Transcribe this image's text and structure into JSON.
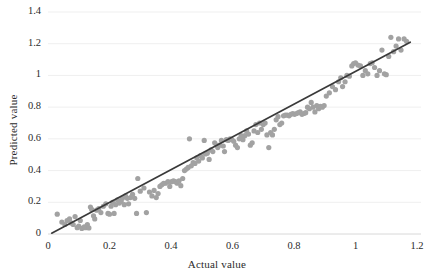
{
  "chart_data": {
    "type": "scatter",
    "title": "",
    "xlabel": "Actual value",
    "ylabel": "Predicted value",
    "xlim": [
      0,
      1.2
    ],
    "ylim": [
      0,
      1.4
    ],
    "xticks": [
      "0",
      "0.2",
      "0.4",
      "0.6",
      "0.8",
      "1",
      "1.2"
    ],
    "xtick_values": [
      0,
      0.2,
      0.4,
      0.6,
      0.8,
      1.0,
      1.2
    ],
    "yticks": [
      "0",
      "0.2",
      "0.4",
      "0.6",
      "0.8",
      "1",
      "1.2",
      "1.4"
    ],
    "ytick_values": [
      0,
      0.2,
      0.4,
      0.6,
      0.8,
      1.0,
      1.2,
      1.4
    ],
    "grid": "horizontal",
    "legend": "none",
    "marker_color": "#a2a2a2",
    "line_color": "#3a3a3a",
    "gridline_color": "#efefef",
    "background_color": "#ffffff",
    "series": [
      {
        "name": "Predicted vs actual",
        "type": "scatter",
        "points": [
          [
            0.03,
            0.125
          ],
          [
            0.045,
            0.075
          ],
          [
            0.055,
            0.06
          ],
          [
            0.062,
            0.085
          ],
          [
            0.07,
            0.095
          ],
          [
            0.075,
            0.07
          ],
          [
            0.082,
            0.06
          ],
          [
            0.088,
            0.11
          ],
          [
            0.095,
            0.04
          ],
          [
            0.1,
            0.05
          ],
          [
            0.105,
            0.085
          ],
          [
            0.11,
            0.035
          ],
          [
            0.118,
            0.045
          ],
          [
            0.122,
            0.04
          ],
          [
            0.128,
            0.06
          ],
          [
            0.133,
            0.038
          ],
          [
            0.138,
            0.17
          ],
          [
            0.142,
            0.155
          ],
          [
            0.148,
            0.115
          ],
          [
            0.152,
            0.095
          ],
          [
            0.158,
            0.15
          ],
          [
            0.165,
            0.16
          ],
          [
            0.172,
            0.135
          ],
          [
            0.18,
            0.175
          ],
          [
            0.188,
            0.19
          ],
          [
            0.195,
            0.13
          ],
          [
            0.2,
            0.125
          ],
          [
            0.205,
            0.175
          ],
          [
            0.21,
            0.2
          ],
          [
            0.215,
            0.13
          ],
          [
            0.22,
            0.185
          ],
          [
            0.226,
            0.215
          ],
          [
            0.232,
            0.195
          ],
          [
            0.238,
            0.205
          ],
          [
            0.242,
            0.225
          ],
          [
            0.248,
            0.185
          ],
          [
            0.252,
            0.24
          ],
          [
            0.258,
            0.225
          ],
          [
            0.262,
            0.19
          ],
          [
            0.268,
            0.23
          ],
          [
            0.275,
            0.25
          ],
          [
            0.282,
            0.225
          ],
          [
            0.288,
            0.13
          ],
          [
            0.292,
            0.35
          ],
          [
            0.3,
            0.27
          ],
          [
            0.312,
            0.29
          ],
          [
            0.32,
            0.135
          ],
          [
            0.33,
            0.265
          ],
          [
            0.338,
            0.24
          ],
          [
            0.345,
            0.275
          ],
          [
            0.352,
            0.23
          ],
          [
            0.358,
            0.255
          ],
          [
            0.364,
            0.3
          ],
          [
            0.37,
            0.31
          ],
          [
            0.376,
            0.32
          ],
          [
            0.382,
            0.32
          ],
          [
            0.39,
            0.33
          ],
          [
            0.396,
            0.3
          ],
          [
            0.402,
            0.33
          ],
          [
            0.408,
            0.335
          ],
          [
            0.414,
            0.33
          ],
          [
            0.42,
            0.32
          ],
          [
            0.426,
            0.335
          ],
          [
            0.432,
            0.305
          ],
          [
            0.438,
            0.35
          ],
          [
            0.444,
            0.4
          ],
          [
            0.45,
            0.41
          ],
          [
            0.456,
            0.42
          ],
          [
            0.46,
            0.6
          ],
          [
            0.466,
            0.43
          ],
          [
            0.472,
            0.45
          ],
          [
            0.478,
            0.445
          ],
          [
            0.484,
            0.48
          ],
          [
            0.49,
            0.46
          ],
          [
            0.496,
            0.495
          ],
          [
            0.502,
            0.48
          ],
          [
            0.508,
            0.59
          ],
          [
            0.512,
            0.505
          ],
          [
            0.518,
            0.51
          ],
          [
            0.524,
            0.47
          ],
          [
            0.53,
            0.53
          ],
          [
            0.536,
            0.52
          ],
          [
            0.542,
            0.575
          ],
          [
            0.548,
            0.56
          ],
          [
            0.552,
            0.545
          ],
          [
            0.558,
            0.56
          ],
          [
            0.564,
            0.59
          ],
          [
            0.57,
            0.555
          ],
          [
            0.574,
            0.52
          ],
          [
            0.58,
            0.595
          ],
          [
            0.586,
            0.59
          ],
          [
            0.592,
            0.6
          ],
          [
            0.598,
            0.595
          ],
          [
            0.604,
            0.585
          ],
          [
            0.61,
            0.56
          ],
          [
            0.616,
            0.545
          ],
          [
            0.622,
            0.6
          ],
          [
            0.628,
            0.62
          ],
          [
            0.634,
            0.595
          ],
          [
            0.64,
            0.62
          ],
          [
            0.646,
            0.65
          ],
          [
            0.652,
            0.63
          ],
          [
            0.658,
            0.56
          ],
          [
            0.664,
            0.575
          ],
          [
            0.67,
            0.65
          ],
          [
            0.676,
            0.69
          ],
          [
            0.682,
            0.64
          ],
          [
            0.688,
            0.7
          ],
          [
            0.694,
            0.66
          ],
          [
            0.7,
            0.69
          ],
          [
            0.706,
            0.7
          ],
          [
            0.712,
            0.625
          ],
          [
            0.718,
            0.545
          ],
          [
            0.724,
            0.64
          ],
          [
            0.73,
            0.625
          ],
          [
            0.736,
            0.66
          ],
          [
            0.742,
            0.72
          ],
          [
            0.748,
            0.74
          ],
          [
            0.754,
            0.69
          ],
          [
            0.76,
            0.7
          ],
          [
            0.766,
            0.745
          ],
          [
            0.772,
            0.75
          ],
          [
            0.778,
            0.75
          ],
          [
            0.784,
            0.745
          ],
          [
            0.79,
            0.755
          ],
          [
            0.796,
            0.76
          ],
          [
            0.802,
            0.755
          ],
          [
            0.808,
            0.76
          ],
          [
            0.814,
            0.765
          ],
          [
            0.82,
            0.77
          ],
          [
            0.826,
            0.755
          ],
          [
            0.832,
            0.76
          ],
          [
            0.838,
            0.765
          ],
          [
            0.844,
            0.8
          ],
          [
            0.85,
            0.79
          ],
          [
            0.856,
            0.83
          ],
          [
            0.862,
            0.8
          ],
          [
            0.868,
            0.77
          ],
          [
            0.874,
            0.81
          ],
          [
            0.88,
            0.79
          ],
          [
            0.886,
            0.805
          ],
          [
            0.892,
            0.8
          ],
          [
            0.898,
            0.81
          ],
          [
            0.905,
            0.87
          ],
          [
            0.915,
            0.89
          ],
          [
            0.925,
            0.93
          ],
          [
            0.935,
            0.91
          ],
          [
            0.945,
            0.96
          ],
          [
            0.952,
            0.985
          ],
          [
            0.958,
            0.93
          ],
          [
            0.966,
            0.96
          ],
          [
            0.972,
            1.0
          ],
          [
            0.98,
            0.995
          ],
          [
            0.988,
            1.06
          ],
          [
            0.994,
            1.075
          ],
          [
            1.0,
            1.08
          ],
          [
            1.008,
            1.065
          ],
          [
            1.016,
            1.06
          ],
          [
            1.024,
            1.0
          ],
          [
            1.032,
            1.03
          ],
          [
            1.04,
            1.01
          ],
          [
            1.048,
            1.075
          ],
          [
            1.054,
            1.08
          ],
          [
            1.062,
            1.05
          ],
          [
            1.07,
            1.0
          ],
          [
            1.078,
            1.03
          ],
          [
            1.086,
            1.16
          ],
          [
            1.094,
            1.01
          ],
          [
            1.1,
            1.005
          ],
          [
            1.108,
            1.12
          ],
          [
            1.115,
            1.24
          ],
          [
            1.124,
            1.15
          ],
          [
            1.132,
            1.185
          ],
          [
            1.14,
            1.23
          ],
          [
            1.148,
            1.16
          ],
          [
            1.158,
            1.23
          ],
          [
            1.166,
            1.215
          ]
        ]
      },
      {
        "name": "Trend line",
        "type": "line",
        "x_start": 0.012,
        "y_start": 0.005,
        "x_end": 1.178,
        "y_end": 1.21
      }
    ]
  }
}
